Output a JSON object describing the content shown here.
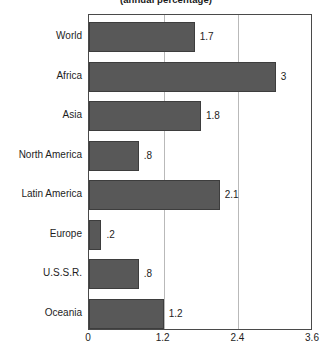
{
  "chart_data": {
    "type": "bar",
    "orientation": "horizontal",
    "title": "(annual percentage)",
    "xlabel": "",
    "ylabel": "",
    "categories": [
      "World",
      "Africa",
      "Asia",
      "North America",
      "Latin America",
      "Europe",
      "U.S.S.R.",
      "Oceania"
    ],
    "values": [
      1.7,
      3,
      1.8,
      0.8,
      2.1,
      0.2,
      0.8,
      1.2
    ],
    "value_labels": [
      "1.7",
      "3",
      "1.8",
      ".8",
      "2.1",
      ".2",
      ".8",
      "1.2"
    ],
    "xlim": [
      0,
      3.6
    ],
    "xticks": [
      0,
      1.2,
      2.4,
      3.6
    ],
    "xtick_labels": [
      "0",
      "1.2",
      "2.4",
      "3.6"
    ],
    "gridlines": [
      1.2,
      2.4
    ],
    "grid": true,
    "legend": null,
    "bar_color": "#585858",
    "bar_edge_color": "#3d3d3d",
    "grid_color": "#b9b9b9",
    "frame_color": "#4a4a4a",
    "text_color": "#1d1d1d",
    "background": "#ffffff"
  }
}
